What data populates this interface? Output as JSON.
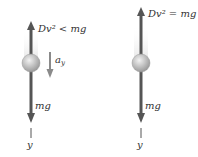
{
  "left": {
    "drag_label": "Dv² < mg",
    "accel_label": "a",
    "accel_sub": "y",
    "weight_label": "mg",
    "axis_label": "y"
  },
  "right": {
    "drag_label": "Dv² = mg",
    "weight_label": "mg",
    "axis_label": "y"
  },
  "colors": {
    "arrow": "#555555",
    "ball": "#bdbdbd",
    "accel": "#8a8a8a"
  }
}
